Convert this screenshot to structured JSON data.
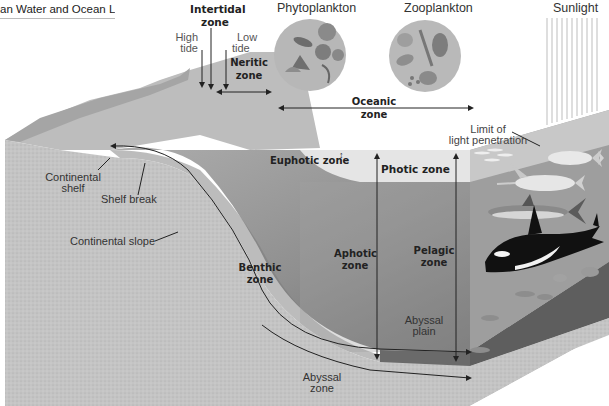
{
  "header": {
    "title": "an Water and Ocean Life"
  },
  "top_labels": {
    "intertidal": "Intertidal zone",
    "intertidal_line1": "Intertidal",
    "intertidal_line2": "zone",
    "high_tide_line1": "High",
    "high_tide_line2": "tide",
    "low_tide_line1": "Low",
    "low_tide_line2": "tide",
    "neritic_line1": "Neritic",
    "neritic_line2": "zone",
    "phytoplankton": "Phytoplankton",
    "zooplankton": "Zooplankton",
    "sunlight": "Sunlight"
  },
  "zone_labels": {
    "oceanic_line1": "Oceanic",
    "oceanic_line2": "zone",
    "limit_line1": "Limit of",
    "limit_line2": "light penetration",
    "euphotic": "Euphotic zone",
    "photic": "Photic zone",
    "aphotic_line1": "Aphotic",
    "aphotic_line2": "zone",
    "pelagic_line1": "Pelagic",
    "pelagic_line2": "zone",
    "benthic_line1": "Benthic",
    "benthic_line2": "zone",
    "abyssal_plain_line1": "Abyssal",
    "abyssal_plain_line2": "plain",
    "abyssal_zone_line1": "Abyssal",
    "abyssal_zone_line2": "zone"
  },
  "landform_labels": {
    "continental_shelf_line1": "Continental",
    "continental_shelf_line2": "shelf",
    "shelf_break": "Shelf break",
    "continental_slope": "Continental slope"
  },
  "illustrations": {
    "phytoplankton_inset": "phytoplankton-circle",
    "zooplankton_inset": "zooplankton-circle",
    "marine_life": [
      "small fish school",
      "tuna",
      "swordfish",
      "shark",
      "orca",
      "small fish",
      "bottom crustaceans"
    ]
  },
  "colors": {
    "water_surface": "#c9c9c9",
    "photic_band": "#e2e2e2",
    "deep_water": "#9a9a9a",
    "seafloor_dark": "#6e6e6e",
    "sediment": "#bdbdbd",
    "text": "#222222"
  }
}
